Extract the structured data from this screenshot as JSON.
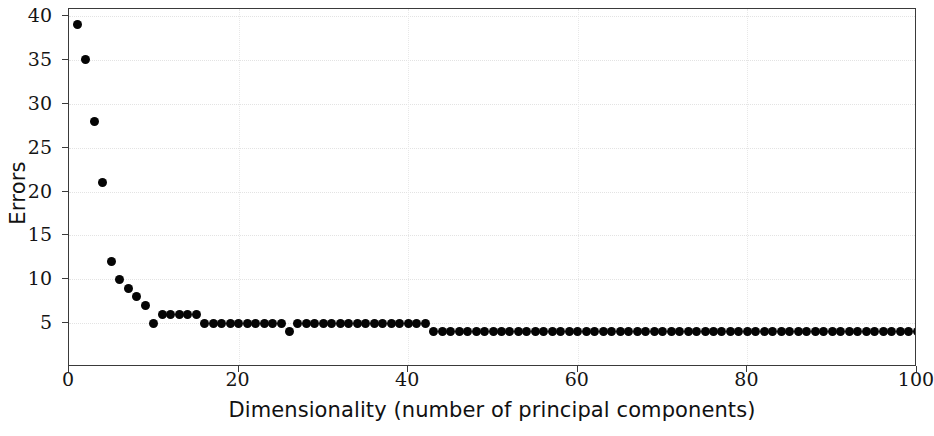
{
  "chart_data": {
    "type": "scatter",
    "title": "",
    "xlabel": "Dimensionality (number of principal components)",
    "ylabel": "Errors",
    "xlim": [
      0,
      100
    ],
    "ylim": [
      0,
      40.8
    ],
    "xticks": [
      0,
      20,
      40,
      60,
      80,
      100
    ],
    "xtick_labels": [
      "0",
      "20",
      "40",
      "60",
      "80",
      "100"
    ],
    "yticks": [
      5,
      10,
      15,
      20,
      25,
      30,
      35,
      40
    ],
    "ytick_labels": [
      "5",
      "10",
      "15",
      "20",
      "25",
      "30",
      "35",
      "40"
    ],
    "grid": true,
    "legend": null,
    "marker": "filled-circle",
    "marker_color": "#050505",
    "marker_size_px": 9,
    "x": [
      1,
      2,
      3,
      4,
      5,
      6,
      7,
      8,
      9,
      10,
      11,
      12,
      13,
      14,
      15,
      16,
      17,
      18,
      19,
      20,
      21,
      22,
      23,
      24,
      25,
      26,
      27,
      28,
      29,
      30,
      31,
      32,
      33,
      34,
      35,
      36,
      37,
      38,
      39,
      40,
      41,
      42,
      43,
      44,
      45,
      46,
      47,
      48,
      49,
      50,
      51,
      52,
      53,
      54,
      55,
      56,
      57,
      58,
      59,
      60,
      61,
      62,
      63,
      64,
      65,
      66,
      67,
      68,
      69,
      70,
      71,
      72,
      73,
      74,
      75,
      76,
      77,
      78,
      79,
      80,
      81,
      82,
      83,
      84,
      85,
      86,
      87,
      88,
      89,
      90,
      91,
      92,
      93,
      94,
      95,
      96,
      97,
      98,
      99,
      100
    ],
    "y": [
      39,
      35,
      28,
      21,
      12,
      10,
      9,
      8,
      7,
      5,
      6,
      6,
      6,
      6,
      6,
      5,
      5,
      5,
      5,
      5,
      5,
      5,
      5,
      5,
      5,
      4,
      5,
      5,
      5,
      5,
      5,
      5,
      5,
      5,
      5,
      5,
      5,
      5,
      5,
      5,
      5,
      5,
      4,
      4,
      4,
      4,
      4,
      4,
      4,
      4,
      4,
      4,
      4,
      4,
      4,
      4,
      4,
      4,
      4,
      4,
      4,
      4,
      4,
      4,
      4,
      4,
      4,
      4,
      4,
      4,
      4,
      4,
      4,
      4,
      4,
      4,
      4,
      4,
      4,
      4,
      4,
      4,
      4,
      4,
      4,
      4,
      4,
      4,
      4,
      4,
      4,
      4,
      4,
      4,
      4,
      4,
      4,
      4,
      4,
      4,
      4,
      4
    ]
  }
}
